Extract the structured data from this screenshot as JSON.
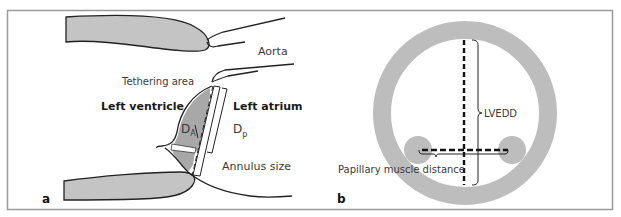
{
  "figure": {
    "frame_color": "#9a9a9a",
    "fill_gray": "#c4c4c4",
    "ring_gray": "#bdbdbd",
    "line_color": "#222222"
  },
  "panel_a": {
    "letter": "a",
    "labels": {
      "aorta": "Aorta",
      "tethering_area": "Tethering area",
      "left_ventricle": "Left ventricle",
      "left_atrium": "Left atrium",
      "d_a_main": "D",
      "d_a_sub": "A",
      "d_p_main": "D",
      "d_p_sub": "p",
      "annulus_size": "Annulus size"
    }
  },
  "panel_b": {
    "letter": "b",
    "labels": {
      "lvedd": "LVEDD",
      "papillary_muscle_distance": "Papillary muscle distance"
    }
  }
}
